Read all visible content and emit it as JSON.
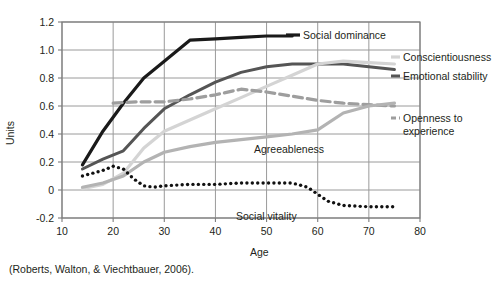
{
  "figure": {
    "citation": "(Roberts, Walton, & Viechtbauer, 2006).",
    "background_color": "#ffffff"
  },
  "labels": {
    "social_dominance": "Social dominance",
    "conscientiousness": "Conscientiousness",
    "emotional_stability": "Emotional stability",
    "openness": "Openness to",
    "openness_line2": "experience",
    "agreeableness": "Agreeableness",
    "social_vitality": "Social vitality"
  },
  "axis": {
    "y_title": "Units",
    "x_title": "Age",
    "y_ticks": [
      "1.2",
      "1.0",
      "0.8",
      "0.6",
      "0.4",
      "0.2",
      "0",
      "-0.2"
    ],
    "x_ticks": [
      "10",
      "20",
      "30",
      "40",
      "50",
      "60",
      "70",
      "80"
    ]
  },
  "chart_data": {
    "type": "line",
    "title": "",
    "xlabel": "Age",
    "ylabel": "Units",
    "xlim": [
      10,
      80
    ],
    "ylim": [
      -0.2,
      1.2
    ],
    "xticks": [
      10,
      20,
      30,
      40,
      50,
      60,
      70,
      80
    ],
    "yticks": [
      -0.2,
      0,
      0.2,
      0.4,
      0.6,
      0.8,
      1.0,
      1.2
    ],
    "grid": true,
    "legend_position": "inline-right-annotations",
    "source": "(Roberts, Walton, & Viechtbauer, 2006).",
    "series": [
      {
        "name": "Social dominance",
        "style": "solid",
        "color": "#1a1a1a",
        "width": 3.2,
        "x": [
          14,
          18,
          22,
          26,
          30,
          35,
          40,
          45,
          50,
          55
        ],
        "values": [
          0.18,
          0.42,
          0.62,
          0.8,
          0.92,
          1.07,
          1.08,
          1.09,
          1.1,
          1.1
        ]
      },
      {
        "name": "Emotional stability",
        "style": "solid",
        "color": "#555555",
        "width": 3.0,
        "x": [
          14,
          18,
          22,
          26,
          30,
          35,
          40,
          45,
          50,
          55,
          60,
          65,
          70,
          75
        ],
        "values": [
          0.15,
          0.22,
          0.28,
          0.44,
          0.58,
          0.68,
          0.77,
          0.84,
          0.88,
          0.9,
          0.9,
          0.9,
          0.88,
          0.86
        ]
      },
      {
        "name": "Conscientiousness",
        "style": "solid",
        "color": "#d4d4d4",
        "width": 3.2,
        "x": [
          14,
          18,
          22,
          26,
          30,
          35,
          40,
          45,
          50,
          55,
          60,
          65,
          70,
          75
        ],
        "values": [
          0.01,
          0.04,
          0.12,
          0.3,
          0.42,
          0.5,
          0.58,
          0.66,
          0.74,
          0.82,
          0.9,
          0.92,
          0.91,
          0.9
        ]
      },
      {
        "name": "Openness to experience",
        "style": "dashed",
        "color": "#9e9e9e",
        "width": 3.2,
        "x": [
          20,
          25,
          30,
          35,
          40,
          45,
          50,
          55,
          60,
          65,
          70,
          75
        ],
        "values": [
          0.62,
          0.63,
          0.63,
          0.65,
          0.68,
          0.72,
          0.7,
          0.67,
          0.64,
          0.62,
          0.61,
          0.6
        ]
      },
      {
        "name": "Agreeableness",
        "style": "solid",
        "color": "#b3b3b3",
        "width": 3.2,
        "x": [
          14,
          18,
          22,
          26,
          30,
          35,
          40,
          45,
          50,
          55,
          60,
          65,
          70,
          75
        ],
        "values": [
          0.02,
          0.05,
          0.1,
          0.2,
          0.27,
          0.31,
          0.34,
          0.36,
          0.38,
          0.4,
          0.43,
          0.55,
          0.6,
          0.62
        ]
      },
      {
        "name": "Social vitality",
        "style": "dotted",
        "color": "#111111",
        "width": 3.4,
        "x": [
          14,
          16,
          18,
          20,
          22,
          24,
          26,
          28,
          30,
          35,
          40,
          45,
          50,
          55,
          58,
          60,
          62,
          65,
          70,
          75
        ],
        "values": [
          0.1,
          0.12,
          0.14,
          0.17,
          0.15,
          0.08,
          0.03,
          0.02,
          0.03,
          0.04,
          0.04,
          0.05,
          0.05,
          0.05,
          0.02,
          -0.03,
          -0.08,
          -0.11,
          -0.12,
          -0.12
        ]
      }
    ]
  }
}
